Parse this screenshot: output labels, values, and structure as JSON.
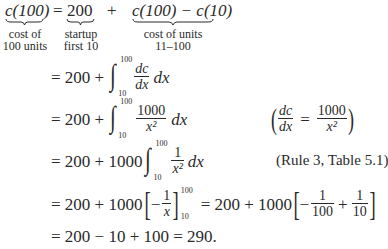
{
  "equation": {
    "line1": {
      "lhs": "c(100)",
      "eq": "=",
      "term1": "200",
      "plus": "+",
      "term2": "c(100) − c(10)",
      "labels": {
        "lhs": [
          "cost of",
          "100 units"
        ],
        "term1": [
          "startup",
          "first 10"
        ],
        "term2": [
          "cost of units",
          "11–100"
        ]
      }
    },
    "line2": {
      "prefix": "= 200 +",
      "integral_upper": "100",
      "integral_lower": "10",
      "frac_num": "dc",
      "frac_den": "dx",
      "suffix": "dx"
    },
    "line3": {
      "prefix": "= 200 +",
      "integral_upper": "100",
      "integral_lower": "10",
      "frac_num": "1000",
      "frac_den": "x²",
      "suffix": "dx",
      "note": {
        "frac1_num": "dc",
        "frac1_den": "dx",
        "eq": "=",
        "frac2_num": "1000",
        "frac2_den": "x²"
      }
    },
    "line4": {
      "prefix": "= 200 + 1000",
      "integral_upper": "100",
      "integral_lower": "10",
      "frac_num": "1",
      "frac_den": "x²",
      "suffix": "dx",
      "note": "(Rule 3, Table 5.1)"
    },
    "line5": {
      "prefix": "= 200 + 1000",
      "frac_num": "1",
      "frac_den": "x",
      "minus": "−",
      "upper": "100",
      "lower": "10",
      "mid": "= 200 + 1000",
      "frac2_num": "1",
      "frac2_den": "100",
      "plus": "+",
      "frac3_num": "1",
      "frac3_den": "10"
    },
    "line6": {
      "text": "= 200 − 10 + 100 = 290."
    }
  }
}
